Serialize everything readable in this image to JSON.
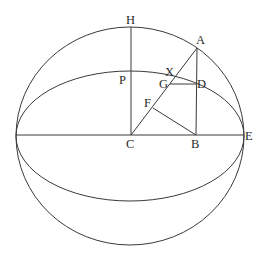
{
  "diagram": {
    "sphere": {
      "cx": 130,
      "cy": 136,
      "rx": 114,
      "ry": 109
    },
    "equator_ellipse": {
      "cx": 130,
      "cy": 136,
      "rx": 114,
      "ry": 65
    },
    "points": {
      "H": {
        "x": 131,
        "y": 27
      },
      "P": {
        "x": 131,
        "y": 71
      },
      "C": {
        "x": 131,
        "y": 135
      },
      "B": {
        "x": 196,
        "y": 135
      },
      "E": {
        "x": 244,
        "y": 135
      },
      "W": {
        "x": 16,
        "y": 135
      },
      "A": {
        "x": 197,
        "y": 48
      },
      "D": {
        "x": 196,
        "y": 84
      },
      "G": {
        "x": 170,
        "y": 84
      },
      "F": {
        "x": 153,
        "y": 108
      },
      "X": {
        "x": 176,
        "y": 76
      }
    },
    "labels": [
      {
        "id": "H",
        "text": "H",
        "x": 126,
        "y": 24
      },
      {
        "id": "A",
        "text": "A",
        "x": 196,
        "y": 44
      },
      {
        "id": "X",
        "text": "X",
        "x": 165,
        "y": 76
      },
      {
        "id": "P",
        "text": "P",
        "x": 119,
        "y": 84
      },
      {
        "id": "G",
        "text": "G",
        "x": 159,
        "y": 88
      },
      {
        "id": "D",
        "text": "D",
        "x": 197,
        "y": 88
      },
      {
        "id": "F",
        "text": "F",
        "x": 144,
        "y": 107
      },
      {
        "id": "C",
        "text": "C",
        "x": 126,
        "y": 148
      },
      {
        "id": "B",
        "text": "B",
        "x": 191,
        "y": 148
      },
      {
        "id": "E",
        "text": "E",
        "x": 245,
        "y": 140
      }
    ]
  }
}
